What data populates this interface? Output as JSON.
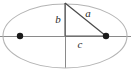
{
  "figure": {
    "kind": "ellipse-right-triangle-diagram",
    "background_color": "#ffffff",
    "width": 131,
    "height": 75
  },
  "ellipse": {
    "name": "ellipse-outline",
    "center_x": 65,
    "center_y": 36,
    "semi_major_axis_px": 62,
    "semi_minor_axis_px": 32,
    "stroke_color": "#b4b4b4"
  },
  "axes": {
    "major_axis": {
      "name": "major-axis-line",
      "x1": 0,
      "y1": 36,
      "x2": 131,
      "y2": 36,
      "color": "#8a8a8a"
    },
    "minor_axis": {
      "name": "minor-axis-line",
      "x1": 65,
      "y1": 3,
      "x2": 65,
      "y2": 68,
      "color": "#8a8a8a"
    }
  },
  "foci": [
    {
      "name": "left-focus-point",
      "x": 20,
      "y": 36,
      "radius": 3.2,
      "color": "#1a1a1a"
    },
    {
      "name": "right-focus-point",
      "x": 106,
      "y": 36,
      "radius": 3.2,
      "color": "#1a1a1a"
    }
  ],
  "triangle": {
    "vertical_leg": {
      "name": "semi-minor-leg-b",
      "x1": 65,
      "y1": 3,
      "x2": 65,
      "y2": 36,
      "color": "#595959"
    },
    "horizontal_leg": {
      "name": "focal-distance-leg-c",
      "x1": 65,
      "y1": 36,
      "x2": 106,
      "y2": 36,
      "color": "#595959"
    },
    "hypotenuse": {
      "name": "semi-major-hypotenuse-a",
      "x1": 65,
      "y1": 3,
      "x2": 106,
      "y2": 36,
      "color": "#4a4a4a"
    }
  },
  "labels": {
    "b": {
      "text": "b",
      "x": 58,
      "y": 20
    },
    "a": {
      "text": "a",
      "x": 88,
      "y": 14
    },
    "c": {
      "text": "c",
      "x": 80,
      "y": 45
    }
  }
}
